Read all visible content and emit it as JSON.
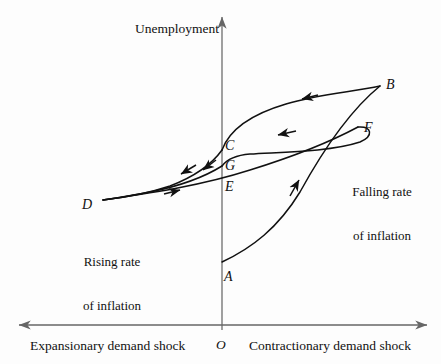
{
  "figure": {
    "type": "economics-hysteresis-diagram",
    "background_color": "#fdfdfd",
    "ink_color": "#111111",
    "axis_color": "#555555"
  },
  "axes": {
    "y_axis_label": "Unemployment",
    "x_axis_label_left": "Expansionary demand shock",
    "x_axis_label_right": "Contractionary demand shock",
    "origin_label": "O"
  },
  "annotations": {
    "left": {
      "line1": "Rising rate",
      "line2": "of inflation"
    },
    "right": {
      "line1": "Falling rate",
      "line2": "of inflation"
    }
  },
  "points": [
    {
      "id": "A",
      "label": "A",
      "x": 228,
      "y": 277
    },
    {
      "id": "B",
      "label": "B",
      "x": 390,
      "y": 85
    },
    {
      "id": "C",
      "label": "C",
      "x": 228,
      "y": 146
    },
    {
      "id": "D",
      "label": "D",
      "x": 86,
      "y": 205
    },
    {
      "id": "E",
      "label": "E",
      "x": 228,
      "y": 187
    },
    {
      "id": "F",
      "label": "F",
      "x": 368,
      "y": 128
    },
    {
      "id": "G",
      "label": "G",
      "x": 228,
      "y": 165
    }
  ],
  "chart_data": {
    "type": "line",
    "title": "",
    "xlabel": "Expansionary demand shock / Contractionary demand shock",
    "ylabel": "Unemployment",
    "grid": false,
    "legend": "none",
    "origin_px": {
      "x": 222,
      "y": 325
    },
    "axis_extent_px": {
      "x_min": 18,
      "x_max": 428,
      "y_top": 15,
      "y_bottom": 325
    },
    "paths": [
      {
        "name": "A-to-B",
        "from": "A",
        "to": "B",
        "direction": "up-right",
        "arrow_at_px": {
          "x": 295,
          "y": 182
        },
        "d": "M 222 262 C 252 248 278 228 300 192 C 322 152 348 112 380 86"
      },
      {
        "name": "B-to-C",
        "from": "B",
        "to": "C",
        "direction": "left",
        "arrow_at_px": {
          "x": 305,
          "y": 98
        },
        "d": "M 380 86 C 352 92 318 94 286 104 C 252 114 230 128 222 150"
      },
      {
        "name": "C-to-D",
        "from": "C",
        "to": "D",
        "direction": "down-left",
        "arrow_at_px": {
          "x": 183,
          "y": 172
        },
        "d": "M 222 150 C 212 164 196 176 170 186 C 146 194 120 198 103 200"
      },
      {
        "name": "D-to-E-to-F",
        "from": "D",
        "to": "F",
        "direction": "right",
        "arrow_at_px": {
          "x": 178,
          "y": 191
        },
        "d": "M 103 200 C 150 193 200 186 250 170 C 292 157 330 142 358 127"
      },
      {
        "name": "F-loop-to-G",
        "from": "F",
        "to": "G",
        "direction": "left",
        "arrow_at_px": {
          "x": 280,
          "y": 134
        },
        "d": "M 358 127 C 372 126 374 136 360 142 C 330 152 280 152 250 154 C 238 155 228 158 222 166"
      },
      {
        "name": "G-to-D",
        "from": "G",
        "to": "D",
        "direction": "down-left",
        "arrow_at_px": {
          "x": 205,
          "y": 168
        },
        "d": "M 222 166 C 206 176 180 186 150 192 C 128 196 110 199 103 200"
      }
    ]
  }
}
